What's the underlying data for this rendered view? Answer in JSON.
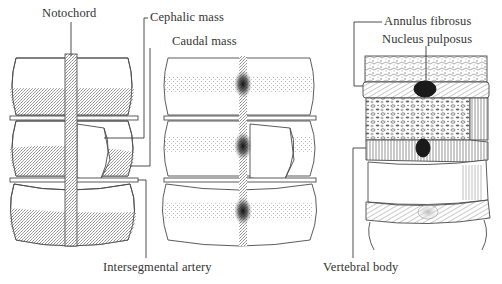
{
  "figure": {
    "panels": [
      {
        "id": "panel-a",
        "description": "Segmenting sclerotomes around notochord"
      },
      {
        "id": "panel-b",
        "description": "Sclerotome resegmentation with dense caudal mass"
      },
      {
        "id": "panel-c",
        "description": "Formed intervertebral disc and vertebral body"
      }
    ],
    "labels": {
      "notochord": "Notochord",
      "cephalic_mass": "Cephalic mass",
      "caudal_mass": "Caudal mass",
      "intersegmental_artery": "Intersegmental artery",
      "annulus_fibrosus": "Annulus fibrosus",
      "nucleus_pulposus": "Nucleus pulposus",
      "vertebral_body": "Vertebral body"
    },
    "caption_fragment": "…"
  },
  "colors": {
    "line": "#4a4a4a",
    "stipple": "#9a9a9a",
    "dense": "#1a1a1a",
    "background": "#ffffff"
  }
}
